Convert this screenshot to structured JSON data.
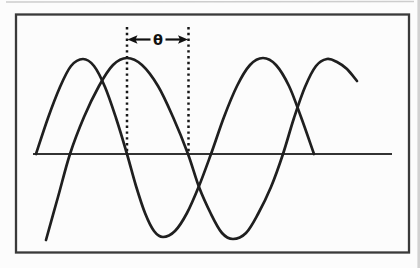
{
  "figure": {
    "phase_label": "θ",
    "colors": {
      "wave": "#1f1f1f",
      "axis": "#333333",
      "frame": "#3a3a3a",
      "marker": "#161616",
      "arrow": "#111111",
      "label": "#101010",
      "paper": "#fcfcfc",
      "scan_artifact": "#c9c9c9"
    },
    "frame": {
      "x": 16,
      "y": 14.5,
      "w": 393,
      "h": 238
    },
    "axis": {
      "x1": 33,
      "x2": 392,
      "y": 154
    },
    "phase_markers": {
      "left_x": 127,
      "right_x": 188.5,
      "top_y": 27,
      "bottom_y": 154,
      "dash": "2.4 3.4"
    },
    "phase_arrow": {
      "y": 39.5,
      "tip_left_x": 127.5,
      "tip_right_x": 188,
      "head_len": 10,
      "head_half": 4.3,
      "shafts": [
        [
          135,
          150.5
        ],
        [
          165.5,
          181
        ]
      ],
      "label_x": 158,
      "label_y": 44.5
    },
    "waves": [
      {
        "name": "wave-1",
        "points": [
          [
            36,
            154
          ],
          [
            48,
            118
          ],
          [
            60,
            87
          ],
          [
            71,
            66
          ],
          [
            83,
            59
          ],
          [
            94,
            66
          ],
          [
            105,
            87
          ],
          [
            116,
            118
          ],
          [
            127,
            154
          ],
          [
            136,
            186
          ],
          [
            145,
            213
          ],
          [
            154,
            231
          ],
          [
            163,
            237
          ],
          [
            175,
            231
          ],
          [
            187,
            213
          ],
          [
            199,
            186
          ],
          [
            211,
            154
          ],
          [
            224,
            117
          ],
          [
            237,
            86
          ],
          [
            250,
            65
          ],
          [
            263,
            58
          ],
          [
            276,
            65
          ],
          [
            289,
            86
          ],
          [
            301,
            117
          ],
          [
            314,
            154
          ]
        ]
      },
      {
        "name": "wave-2",
        "points": [
          [
            46,
            240
          ],
          [
            58,
            197
          ],
          [
            70,
            154
          ],
          [
            84,
            117
          ],
          [
            99,
            86
          ],
          [
            113,
            65
          ],
          [
            127,
            58
          ],
          [
            142,
            65
          ],
          [
            158,
            86
          ],
          [
            173,
            117
          ],
          [
            188,
            154
          ],
          [
            199,
            187
          ],
          [
            211,
            214
          ],
          [
            222,
            233
          ],
          [
            233,
            239
          ],
          [
            246,
            233
          ],
          [
            258,
            214
          ],
          [
            271,
            187
          ],
          [
            283,
            154
          ],
          [
            294,
            118
          ],
          [
            305,
            87
          ],
          [
            316,
            66
          ],
          [
            327,
            59
          ],
          [
            337,
            62
          ],
          [
            347,
            69
          ],
          [
            357,
            81
          ]
        ]
      }
    ]
  }
}
